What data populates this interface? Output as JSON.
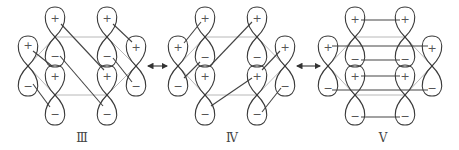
{
  "figure": {
    "type": "resonance structures of p-orbital (pi) overlap in a six-membered ring",
    "colors": {
      "orbital_outline": "#3a3a3a",
      "ring_frame": "#b8b8b8",
      "overlap_lines": "#444444"
    },
    "signs": {
      "plus": "+",
      "minus": "−"
    },
    "structures": [
      {
        "id": "III",
        "label": "Ⅲ",
        "overlap_pattern": "diagonal, top-left to bottom-right"
      },
      {
        "id": "IV",
        "label": "Ⅳ",
        "overlap_pattern": "diagonal, bottom-left to top-right"
      },
      {
        "id": "V",
        "label": "Ⅴ",
        "overlap_pattern": "horizontal lobe-to-lobe"
      }
    ],
    "resonance_arrows": [
      {
        "between": [
          "III",
          "IV"
        ],
        "symbol": "↔"
      },
      {
        "between": [
          "IV",
          "V"
        ],
        "symbol": "↔"
      }
    ]
  }
}
